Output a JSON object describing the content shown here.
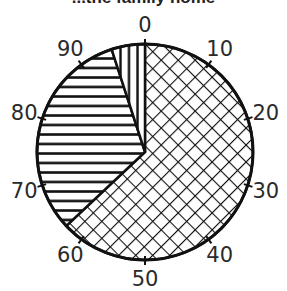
{
  "title": "...the family home",
  "chart_data": {
    "type": "pie",
    "title": "...the family home",
    "scale": {
      "min": 0,
      "max": 100,
      "step": 10,
      "tick_labels": [
        "0",
        "10",
        "20",
        "30",
        "40",
        "50",
        "60",
        "70",
        "80",
        "90"
      ]
    },
    "segments": [
      {
        "name": "crosshatch",
        "pattern": "crosshatch",
        "start": 0,
        "end": 63,
        "value": 63
      },
      {
        "name": "horizontal-stripes",
        "pattern": "horizontal",
        "start": 63,
        "end": 95,
        "value": 32
      },
      {
        "name": "vertical-stripes",
        "pattern": "vertical",
        "start": 95,
        "end": 100,
        "value": 5
      }
    ],
    "legend": "none",
    "grid": false
  }
}
